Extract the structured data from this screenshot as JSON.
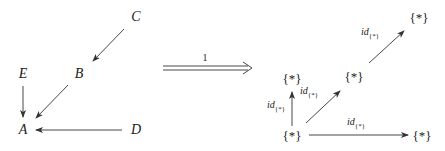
{
  "left_diagram": {
    "nodes": {
      "A": "A",
      "B": "B",
      "C": "C",
      "D": "D",
      "E": "E"
    },
    "arrows": [
      {
        "from": "C",
        "to": "B"
      },
      {
        "from": "B",
        "to": "A"
      },
      {
        "from": "E",
        "to": "A"
      },
      {
        "from": "D",
        "to": "A"
      }
    ]
  },
  "functor_arrow": {
    "label": "1",
    "style": "double"
  },
  "right_diagram": {
    "nodes": {
      "A": "{*}",
      "B": "{*}",
      "C": "{*}",
      "D": "{*}",
      "E": "{*}"
    },
    "arrows": [
      {
        "from": "A",
        "to": "E",
        "label_main": "id",
        "label_sub": "{*}"
      },
      {
        "from": "A",
        "to": "B",
        "label_main": "id",
        "label_sub": "{*}"
      },
      {
        "from": "B",
        "to": "C",
        "label_main": "id",
        "label_sub": "{*}"
      },
      {
        "from": "A",
        "to": "D",
        "label_main": "id",
        "label_sub": "{*}"
      }
    ]
  },
  "colors": {
    "line": "#333333",
    "text": "#222222",
    "background": "#ffffff"
  }
}
